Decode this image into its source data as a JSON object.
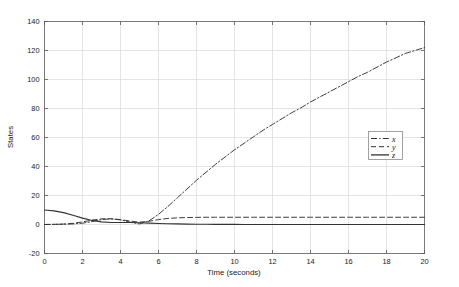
{
  "chart_data": {
    "type": "line",
    "title": "",
    "xlabel": "Time (seconds)",
    "ylabel": "States",
    "xlim": [
      0,
      20
    ],
    "ylim": [
      -20,
      140
    ],
    "xticks": [
      0,
      2,
      4,
      6,
      8,
      10,
      12,
      14,
      16,
      18,
      20
    ],
    "yticks": [
      -20,
      0,
      20,
      40,
      60,
      80,
      100,
      120,
      140
    ],
    "xtick_labels": [
      "0",
      "2",
      "4",
      "6",
      "8",
      "10",
      "12",
      "14",
      "16",
      "18",
      "20"
    ],
    "ytick_labels": [
      "-20",
      "0",
      "20",
      "40",
      "60",
      "80",
      "100",
      "120",
      "140"
    ],
    "grid": true,
    "legend_position": "center-right",
    "x": [
      0,
      0.5,
      1,
      1.5,
      2,
      2.5,
      3,
      3.5,
      4,
      4.5,
      5,
      5.5,
      6,
      6.5,
      7,
      7.5,
      8,
      8.5,
      9,
      9.5,
      10,
      10.5,
      11,
      11.5,
      12,
      12.5,
      13,
      13.5,
      14,
      14.5,
      15,
      15.5,
      16,
      16.5,
      17,
      17.5,
      18,
      18.5,
      19,
      19.5,
      20
    ],
    "series": [
      {
        "name": "x",
        "label": "x",
        "linestyle": "dashdot",
        "color": "#333333",
        "values": [
          0,
          0.1,
          0.2,
          0.4,
          0.9,
          2.0,
          3.4,
          3.9,
          3.2,
          1.6,
          0.4,
          2.5,
          7.0,
          12.5,
          18.5,
          24.5,
          30.5,
          36.0,
          41.5,
          46.5,
          51.5,
          56.0,
          60.5,
          65.0,
          69.0,
          73.0,
          77.0,
          80.5,
          84.5,
          88.0,
          91.5,
          95.0,
          98.5,
          102.0,
          105.0,
          108.5,
          112.0,
          115.0,
          118.0,
          120.0,
          122.0
        ]
      },
      {
        "name": "y",
        "label": "y",
        "linestyle": "dashed",
        "color": "#333333",
        "values": [
          0,
          0.1,
          0.3,
          0.8,
          1.8,
          3.0,
          3.9,
          4.0,
          3.4,
          2.4,
          1.6,
          2.2,
          3.4,
          4.2,
          4.6,
          4.8,
          4.9,
          5.0,
          5.0,
          5.0,
          5.0,
          5.0,
          5.0,
          5.0,
          5.0,
          5.0,
          5.0,
          5.0,
          5.0,
          5.0,
          5.0,
          5.0,
          5.0,
          5.0,
          5.0,
          5.0,
          5.0,
          5.0,
          5.0,
          5.0,
          5.0
        ]
      },
      {
        "name": "z",
        "label": "z",
        "linestyle": "solid",
        "color": "#333333",
        "values": [
          10.0,
          9.4,
          8.2,
          6.4,
          4.4,
          2.8,
          1.8,
          1.4,
          1.4,
          1.4,
          1.2,
          0.9,
          0.7,
          0.5,
          0.4,
          0.3,
          0.2,
          0.2,
          0.1,
          0.1,
          0.1,
          0.0,
          0.0,
          0.0,
          0.0,
          0.0,
          0.0,
          0.0,
          0.0,
          0.0,
          0.0,
          0.0,
          0.0,
          0.0,
          0.0,
          0.0,
          0.0,
          0.0,
          0.0,
          0.0,
          0.0
        ]
      }
    ]
  },
  "figure": {
    "background_color": "#ffffff",
    "axes_color": "#7a7a7a",
    "grid_color": "#d8d8d8",
    "line_color": "#333333"
  }
}
